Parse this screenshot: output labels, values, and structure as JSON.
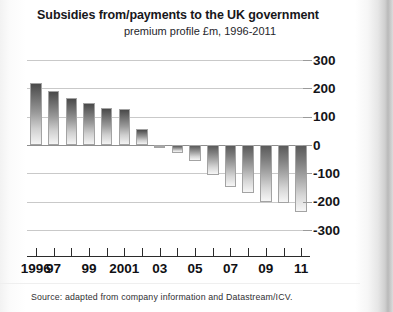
{
  "chart_data": {
    "type": "bar",
    "title": "Subsidies from/payments to the UK government",
    "subtitle": "premium profile £m, 1996-2011",
    "xlabel": "",
    "ylabel": "",
    "ylim": [
      -300,
      300
    ],
    "yticks": [
      300,
      200,
      100,
      0,
      -100,
      -200,
      -300
    ],
    "ytick_labels": [
      "300",
      "200",
      "100",
      "0",
      "-100",
      "-200",
      "-300"
    ],
    "grid": true,
    "legend": "none",
    "categories": [
      "1996",
      "1997",
      "1998",
      "1999",
      "2000",
      "2001",
      "2002",
      "2003",
      "2004",
      "2005",
      "2006",
      "2007",
      "2008",
      "2009",
      "2010",
      "2011"
    ],
    "tick_labels": [
      "1996",
      "97",
      "",
      "99",
      "",
      "2001",
      "",
      "03",
      "",
      "05",
      "",
      "07",
      "",
      "09",
      "",
      "11"
    ],
    "values": [
      220,
      190,
      165,
      148,
      132,
      128,
      55,
      -10,
      -28,
      -55,
      -105,
      -148,
      -170,
      -200,
      -205,
      -235
    ],
    "bar_style": "vertical gradient dark-to-light, thin grey outline"
  },
  "header": {
    "title": "Subsidies from/payments to the UK government",
    "subtitle": "premium profile £m, 1996-2011"
  },
  "footer": {
    "source": "Source: adapted from company information and Datastream/ICV."
  }
}
